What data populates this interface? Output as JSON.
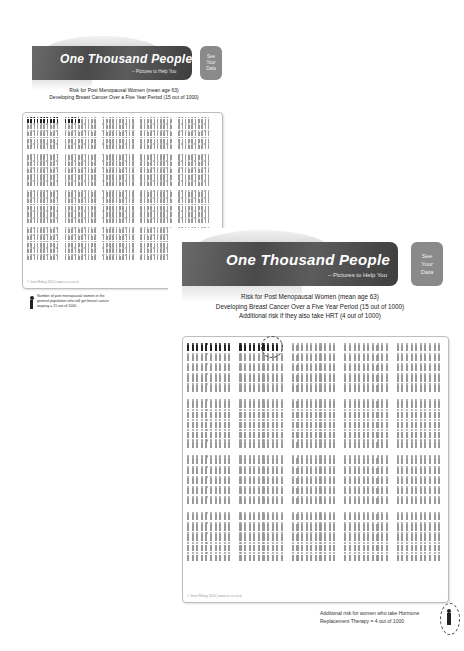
{
  "brand": {
    "title": "One Thousand People",
    "subtitle": "– Pictures to Help You",
    "see_data_button": [
      "See",
      "Your",
      "Data"
    ]
  },
  "chart1": {
    "caption_lines": [
      "Risk for Post Menopausal Women (mean age 63)",
      "Developing Breast Cancer Over a Five Year Period (15 out of 1000)"
    ],
    "footer": "© Jenni Riding 2010 | www.cx-cx.co.uk",
    "legend": "Number of post menopausal women in the general population who will get breast cancer anyway = 15 out of 1000"
  },
  "chart2": {
    "caption_lines": [
      "Risk for Post Menopausal Women (mean age 63)",
      "Developing Breast Cancer Over a Five Year Period (15 out of 1000)",
      "Additional risk if they also take HRT (4 out of 1000)"
    ],
    "footer": "© Jenni Riding 2010 | www.cx-cx.co.uk",
    "legend": "Additional risk for women who take Hormone Replacement Therapy = 4 out of 1000"
  },
  "colors": {
    "affected": "#222222",
    "unaffected": "#9a9a9a",
    "banner": "#4a4a4a",
    "button": "#8a8a8a"
  },
  "chart_data": [
    {
      "type": "pictograph",
      "title": "Risk for Post Menopausal Women (mean age 63) Developing Breast Cancer Over a Five Year Period (15 out of 1000)",
      "total": 1000,
      "layout": {
        "blocks": 4,
        "rows_per_block": 5,
        "groups_per_row": 5,
        "figures_per_group": 10
      },
      "series": [
        {
          "name": "Get breast cancer anyway",
          "value": 15,
          "color": "#222222"
        },
        {
          "name": "Unaffected",
          "value": 985,
          "color": "#9a9a9a"
        }
      ]
    },
    {
      "type": "pictograph",
      "title": "Risk for Post Menopausal Women (mean age 63) Developing Breast Cancer Over a Five Year Period (15 out of 1000) Additional risk if they also take HRT (4 out of 1000)",
      "total": 1000,
      "layout": {
        "blocks": 4,
        "rows_per_block": 5,
        "groups_per_row": 5,
        "figures_per_group": 10
      },
      "series": [
        {
          "name": "Get breast cancer anyway",
          "value": 15,
          "color": "#222222"
        },
        {
          "name": "Additional risk with HRT (circled)",
          "value": 4,
          "color": "#222222"
        },
        {
          "name": "Unaffected",
          "value": 981,
          "color": "#9a9a9a"
        }
      ]
    }
  ]
}
